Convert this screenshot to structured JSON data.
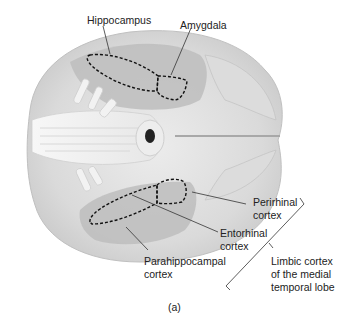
{
  "figure": {
    "panel_label": "(a)",
    "colors": {
      "background": "#ffffff",
      "brain_light": "#e4e4e4",
      "brain_mid": "#cfcfcf",
      "brain_shadow": "#b8b8b8",
      "cortex_region": "#a9a9a9",
      "brainstem": "#f2f2f2",
      "outline_dashed": "#111111",
      "leader_line": "#333333"
    },
    "labels": {
      "hippocampus": "Hippocampus",
      "amygdala": "Amygdala",
      "perirhinal_1": "Perirhinal",
      "perirhinal_2": "cortex",
      "entorhinal_1": "Entorhinal",
      "entorhinal_2": "cortex",
      "parahippocampal_1": "Parahippocampal",
      "parahippocampal_2": "cortex",
      "limbic_1": "Limbic cortex",
      "limbic_2": "of the medial",
      "limbic_3": "temporal lobe"
    }
  }
}
